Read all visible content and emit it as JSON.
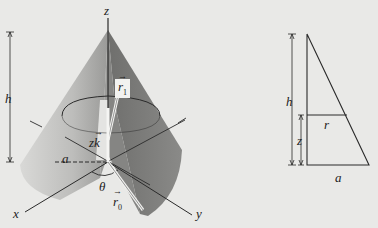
{
  "figure": {
    "left_panel": {
      "description": "3D cone with axes and vectors",
      "labels": {
        "z_axis": "z",
        "x_axis": "x",
        "y_axis": "y",
        "height": "h",
        "radius": "a",
        "angle": "θ",
        "vector_r1": "r",
        "vector_r1_sub": "1",
        "vector_r0": "r",
        "vector_r0_sub": "0",
        "vector_zk_z": "z",
        "vector_zk_k": "k"
      }
    },
    "right_panel": {
      "description": "Cross-section right triangle",
      "labels": {
        "height": "h",
        "radius": "r",
        "z": "z",
        "base": "a"
      }
    },
    "colors": {
      "background": "#e9e9e7",
      "cone_dark": "#7a7a78",
      "cone_light": "#c9c9c7",
      "line": "#2a2a2a"
    }
  }
}
